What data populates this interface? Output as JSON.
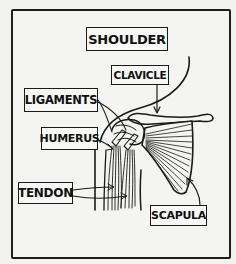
{
  "diagram": {
    "title": "SHOULDER",
    "labels": {
      "clavicle": "CLAVICLE",
      "ligaments": "LIGAMENTS",
      "humerus": "HUMERUS",
      "tendon": "TENDON",
      "scapula": "SCAPULA"
    },
    "style": {
      "ink_color": "#1a1a1a",
      "paper_color": "#f2f2f0"
    }
  }
}
